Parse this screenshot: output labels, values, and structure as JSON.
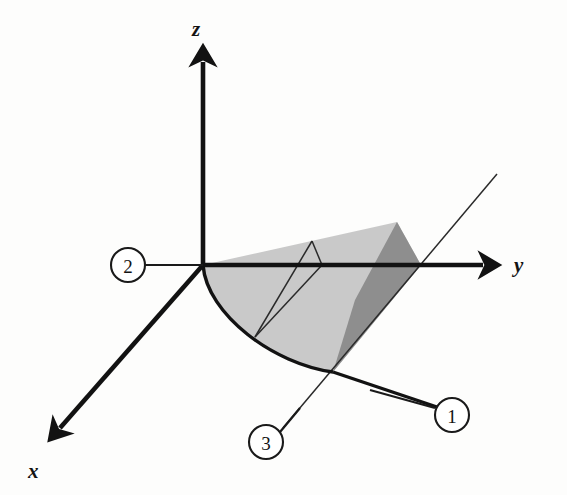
{
  "figure": {
    "background_color": "#fdfdfc",
    "ink_color": "#121212"
  },
  "axes": [
    {
      "id": "z",
      "label": "z",
      "data_name": "axis-label-z",
      "direction": "up",
      "label_x": 192,
      "label_y": 36,
      "line": {
        "x1": 203,
        "y1": 265,
        "x2": 203,
        "y2": 62
      },
      "arrow": "up"
    },
    {
      "id": "y",
      "label": "y",
      "data_name": "axis-label-y",
      "direction": "right",
      "label_x": 514,
      "label_y": 272,
      "line": {
        "x1": 203,
        "y1": 265,
        "x2": 483,
        "y2": 265
      },
      "arrow": "right"
    },
    {
      "id": "x",
      "label": "x",
      "data_name": "axis-label-x",
      "direction": "down-left",
      "label_x": 28,
      "label_y": 478,
      "line": {
        "x1": 203,
        "y1": 265,
        "x2": 60,
        "y2": 428
      },
      "arrow": "down-left"
    }
  ],
  "callouts": [
    {
      "id": "callout-1",
      "label": "1",
      "cx": 452,
      "cy": 415,
      "r": 17,
      "leader": {
        "x1": 435,
        "y1": 408,
        "x2": 370,
        "y2": 390
      },
      "points_at": "lower boundary curve of the region"
    },
    {
      "id": "callout-2",
      "label": "2",
      "cx": 128,
      "cy": 265,
      "r": 17,
      "leader": {
        "x1": 145,
        "y1": 265,
        "x2": 203,
        "y2": 265
      },
      "points_at": "origin / negative y direction"
    },
    {
      "id": "callout-3",
      "label": "3",
      "cx": 266,
      "cy": 442,
      "r": 17,
      "leader": {
        "x1": 280,
        "y1": 432,
        "x2": 300,
        "y2": 408
      },
      "points_at": "slanted straight line through the region"
    }
  ],
  "region": {
    "light_fill": "#c9c9c9",
    "dark_fill": "#8e8e8e",
    "light_upper_triangle": "M 203,265 L 397,222 L 421,265 Z",
    "light_lower_sector": "M 203,265 C 205,312 272,362 333,372 L 421,265 Z",
    "dark_face": "M 397,222 L 421,265 L 333,372 L 355,300 Z",
    "outline_arc": "M 203,265 C 207,315 274,364 333,372",
    "arc_extension": "M 333,372 L 437,407"
  },
  "inner_lines": {
    "triangle_apex": {
      "x": 312,
      "y": 241
    },
    "arc_foot": {
      "x": 255,
      "y": 337
    },
    "axis_foot": {
      "x": 322,
      "y": 265
    },
    "segments": [
      {
        "x1": 312,
        "y1": 241,
        "x2": 255,
        "y2": 337
      },
      {
        "x1": 312,
        "y1": 241,
        "x2": 322,
        "y2": 265
      },
      {
        "x1": 322,
        "y1": 265,
        "x2": 255,
        "y2": 337
      }
    ]
  },
  "solid_line_3": {
    "x1": 283,
    "y1": 428,
    "x2": 497,
    "y2": 174,
    "stroke": "#2a2a2a"
  }
}
